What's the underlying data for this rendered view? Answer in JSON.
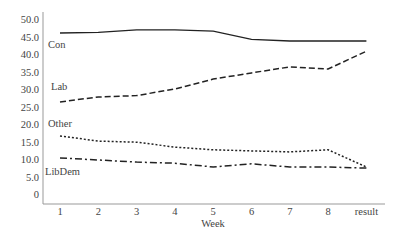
{
  "chart_data": {
    "type": "line",
    "title": "",
    "xlabel": "Week",
    "ylabel": "",
    "categories": [
      "1",
      "2",
      "3",
      "4",
      "5",
      "6",
      "7",
      "8",
      "result"
    ],
    "y_ticks": [
      "50.0",
      "45.0",
      "40.0",
      "35.0",
      "30.0",
      "25.0",
      "20.0",
      "15.0",
      "10.0",
      "5.0",
      "0"
    ],
    "ylim": [
      0,
      50
    ],
    "grid": false,
    "legend": "inline labels at left of lines",
    "series": [
      {
        "name": "Con",
        "style": "solid",
        "values": [
          46.3,
          46.5,
          47.2,
          47.2,
          46.8,
          44.5,
          44.0,
          44.0,
          44.0
        ]
      },
      {
        "name": "Lab",
        "style": "dashed",
        "values": [
          26.6,
          28.0,
          28.4,
          30.3,
          33.1,
          34.9,
          36.6,
          36.0,
          41.1
        ]
      },
      {
        "name": "Other",
        "style": "dotted",
        "values": [
          16.9,
          15.4,
          15.1,
          13.7,
          12.9,
          12.6,
          12.3,
          12.9,
          8.0
        ]
      },
      {
        "name": "LibDem",
        "style": "dashdot",
        "values": [
          10.6,
          10.0,
          9.4,
          9.1,
          8.0,
          8.9,
          8.0,
          8.0,
          7.7
        ]
      }
    ]
  },
  "labels": {
    "xlabel": "Week",
    "series": {
      "con": "Con",
      "lab": "Lab",
      "other": "Other",
      "libdem": "LibDem"
    }
  },
  "colors": {
    "line": "#222222",
    "axis": "#999999",
    "text": "#444444"
  }
}
